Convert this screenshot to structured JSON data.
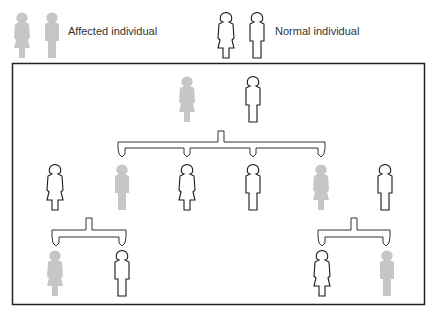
{
  "legend": {
    "affected_label": "Affected individual",
    "normal_label": "Normal individual"
  },
  "colors": {
    "affected": "#c6c6c6",
    "normal_stroke": "#1a1a1a",
    "frame": "#222222"
  },
  "pedigree": {
    "generation_1": [
      {
        "sex": "female",
        "status": "affected"
      },
      {
        "sex": "male",
        "status": "normal"
      }
    ],
    "generation_2": [
      {
        "sex": "female",
        "status": "normal",
        "note": "married-in"
      },
      {
        "sex": "male",
        "status": "affected"
      },
      {
        "sex": "female",
        "status": "normal"
      },
      {
        "sex": "male",
        "status": "normal"
      },
      {
        "sex": "female",
        "status": "affected"
      },
      {
        "sex": "male",
        "status": "normal",
        "note": "married-in"
      }
    ],
    "generation_3_left": [
      {
        "sex": "female",
        "status": "affected"
      },
      {
        "sex": "male",
        "status": "normal"
      }
    ],
    "generation_3_right": [
      {
        "sex": "female",
        "status": "normal"
      },
      {
        "sex": "male",
        "status": "affected"
      }
    ]
  }
}
